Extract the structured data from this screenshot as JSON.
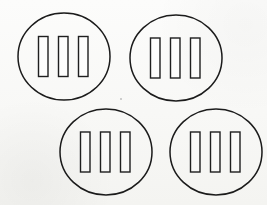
{
  "image": {
    "title": "Four circles each containing three vertical bars",
    "description": "Line drawing of four outlined ellipses arranged in a staggered two-by-two grid; each ellipse encloses three tall narrow vertical rectangles.",
    "width": 267,
    "height": 205,
    "background_color": "#fcfcfb",
    "stroke_color": "#1b1b1b",
    "bar_fill_color": "#ffffff",
    "stroke_width": 1.5,
    "bar_stroke_width": 1.4,
    "shape_count": 4,
    "bars_per_shape": 3
  },
  "shapes": [
    {
      "name": "circle-top-left",
      "label": "Top-left circle",
      "cx": 64,
      "cy": 56.5,
      "rx": 46,
      "ry": 43.5,
      "bars": [
        {
          "name": "bar-1",
          "x": 38.5,
          "y": 36.5,
          "width": 9.5,
          "height": 40
        },
        {
          "name": "bar-2",
          "x": 58.5,
          "y": 36.5,
          "width": 9.5,
          "height": 40
        },
        {
          "name": "bar-3",
          "x": 78.5,
          "y": 36.5,
          "width": 9.5,
          "height": 40
        }
      ]
    },
    {
      "name": "circle-top-right",
      "label": "Top-right circle",
      "cx": 176,
      "cy": 58,
      "rx": 46,
      "ry": 43,
      "bars": [
        {
          "name": "bar-1",
          "x": 150.5,
          "y": 38,
          "width": 9.5,
          "height": 40
        },
        {
          "name": "bar-2",
          "x": 170.5,
          "y": 38,
          "width": 9.5,
          "height": 40
        },
        {
          "name": "bar-3",
          "x": 190.5,
          "y": 38,
          "width": 9.5,
          "height": 40
        }
      ]
    },
    {
      "name": "circle-bottom-left",
      "label": "Bottom-left circle",
      "cx": 106,
      "cy": 152,
      "rx": 46,
      "ry": 43,
      "bars": [
        {
          "name": "bar-1",
          "x": 80.5,
          "y": 132,
          "width": 9.5,
          "height": 40
        },
        {
          "name": "bar-2",
          "x": 100.5,
          "y": 132,
          "width": 9.5,
          "height": 40
        },
        {
          "name": "bar-3",
          "x": 120.5,
          "y": 132,
          "width": 9.5,
          "height": 40
        }
      ]
    },
    {
      "name": "circle-bottom-right",
      "label": "Bottom-right circle",
      "cx": 216,
      "cy": 152,
      "rx": 46,
      "ry": 43,
      "bars": [
        {
          "name": "bar-1",
          "x": 190.5,
          "y": 132,
          "width": 9.5,
          "height": 40
        },
        {
          "name": "bar-2",
          "x": 210.5,
          "y": 132,
          "width": 9.5,
          "height": 40
        },
        {
          "name": "bar-3",
          "x": 230.5,
          "y": 132,
          "width": 9.5,
          "height": 40
        }
      ]
    }
  ],
  "artifacts": [
    {
      "name": "scan-speck",
      "cx": 121,
      "cy": 99,
      "r": 0.9
    }
  ]
}
